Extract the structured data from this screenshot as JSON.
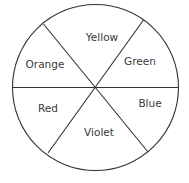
{
  "diagram": {
    "type": "color-wheel",
    "segments": [
      {
        "label": "Yellow"
      },
      {
        "label": "Green"
      },
      {
        "label": "Blue"
      },
      {
        "label": "Violet"
      },
      {
        "label": "Red"
      },
      {
        "label": "Orange"
      }
    ],
    "colors": {
      "stroke": "#333333",
      "text": "#3a3a3a",
      "background": "#ffffff"
    }
  }
}
